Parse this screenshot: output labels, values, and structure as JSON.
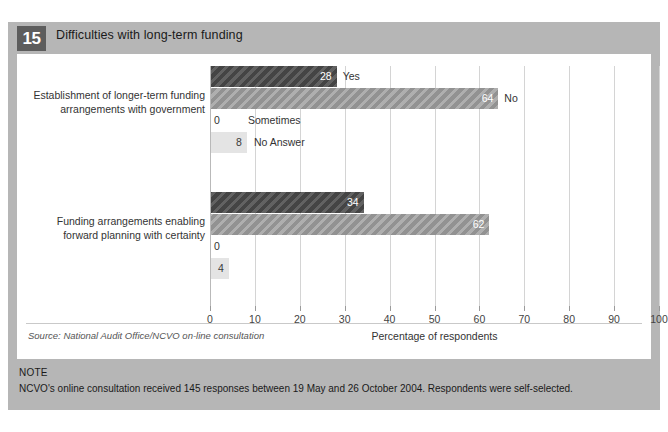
{
  "figure": {
    "number": "15",
    "title": "Difficulties with long-term funding",
    "source": "Source: National Audit Office/NCVO on-line consultation",
    "note_label": "NOTE",
    "note_text": "NCVO's online consultation received 145 responses between 19 May and 26 October 2004. Respondents were self-selected.",
    "colors": {
      "panel_background": "#b6b6b6",
      "card_background": "#ffffff",
      "number_badge": "#5d5d5d",
      "series_yes": "#4c4c4c",
      "series_no": "#9d9d9d",
      "series_sometimes": "#ffffff",
      "series_no_answer": "#e4e4e4",
      "gridline": "#d4d4d4"
    }
  },
  "chart_data": {
    "type": "bar",
    "orientation": "horizontal",
    "title": "Difficulties with long-term funding",
    "xlabel": "Percentage of respondents",
    "ylabel": "",
    "xlim": [
      0,
      100
    ],
    "xticks": [
      0,
      10,
      20,
      30,
      40,
      50,
      60,
      70,
      80,
      90,
      100
    ],
    "xticklabels": [
      "0",
      "10",
      "20",
      "30",
      "40",
      "50",
      "60",
      "70",
      "80",
      "90",
      "100"
    ],
    "grid": true,
    "legend": "inline-labels",
    "categories": [
      "Establishment of longer-term funding arrangements with government",
      "Funding arrangements enabling forward planning with certainty"
    ],
    "series": [
      {
        "name": "Yes",
        "values": [
          28,
          34
        ]
      },
      {
        "name": "No",
        "values": [
          64,
          62
        ]
      },
      {
        "name": "Sometimes",
        "values": [
          0,
          0
        ]
      },
      {
        "name": "No Answer",
        "values": [
          8,
          4
        ]
      }
    ],
    "groups": [
      {
        "category_line1": "Establishment of longer-term funding",
        "category_line2": "arrangements with government",
        "show_response_labels": true,
        "bars": [
          {
            "response": "Yes",
            "value": 28,
            "value_text": "28",
            "style": "dark"
          },
          {
            "response": "No",
            "value": 64,
            "value_text": "64",
            "style": "mid"
          },
          {
            "response": "Sometimes",
            "value": 0,
            "value_text": "0",
            "style": "zero"
          },
          {
            "response": "No Answer",
            "value": 8,
            "value_text": "8",
            "style": "light"
          }
        ]
      },
      {
        "category_line1": "Funding arrangements enabling",
        "category_line2": "forward planning with certainty",
        "show_response_labels": false,
        "bars": [
          {
            "response": "Yes",
            "value": 34,
            "value_text": "34",
            "style": "dark"
          },
          {
            "response": "No",
            "value": 62,
            "value_text": "62",
            "style": "mid"
          },
          {
            "response": "Sometimes",
            "value": 0,
            "value_text": "0",
            "style": "zero"
          },
          {
            "response": "No Answer",
            "value": 4,
            "value_text": "4",
            "style": "light"
          }
        ]
      }
    ]
  }
}
